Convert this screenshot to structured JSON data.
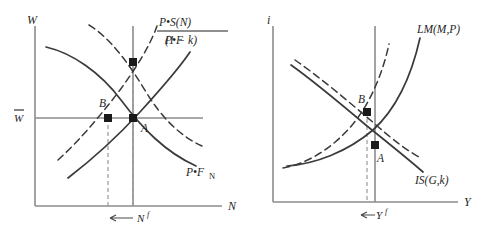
{
  "figure": {
    "panels": [
      {
        "id": "labor-market",
        "y_axis_label": "W",
        "x_axis_label": "N",
        "wage_level_label": "W",
        "wage_level_overbar": true,
        "employment_tick_label": "N",
        "employment_tick_superscript": "f",
        "curves": [
          {
            "name": "labor-supply",
            "label_numerator": "P•S(N)",
            "label_denominator": "(1 − k)",
            "style": "solid",
            "slope": "upward"
          },
          {
            "name": "labor-demand",
            "label": "P•F",
            "label_subscript": "N",
            "style": "solid",
            "slope": "downward"
          },
          {
            "name": "labor-supply-shifted",
            "style": "dashed",
            "slope": "upward"
          },
          {
            "name": "labor-demand-shifted",
            "style": "dashed",
            "slope": "downward"
          }
        ],
        "points": [
          {
            "label": "A",
            "position": "intersection-on-full-employment"
          },
          {
            "label": "B",
            "position": "left-of-A-on-wage-line"
          }
        ],
        "arrow_direction": "left"
      },
      {
        "id": "is-lm",
        "y_axis_label": "i",
        "x_axis_label": "Y",
        "output_tick_label": "Y",
        "output_tick_superscript": "f",
        "curves": [
          {
            "name": "lm-curve",
            "label": "LM(M,P)",
            "style": "solid",
            "slope": "upward"
          },
          {
            "name": "is-curve",
            "label": "IS(G,k)",
            "style": "solid",
            "slope": "downward"
          },
          {
            "name": "lm-curve-shifted",
            "style": "dashed",
            "slope": "upward"
          },
          {
            "name": "is-curve-shifted",
            "style": "dashed",
            "slope": "downward"
          }
        ],
        "points": [
          {
            "label": "A",
            "position": "lower-intersection"
          },
          {
            "label": "B",
            "position": "upper-intersection"
          }
        ],
        "arrow_direction": "left"
      }
    ],
    "colors": {
      "curve": "#3a3a3a",
      "axis": "#8c8c8c",
      "guide": "#9a9a9a",
      "point": "#1a1a1a",
      "text": "#1f1f1f",
      "background": "#ffffff"
    }
  }
}
